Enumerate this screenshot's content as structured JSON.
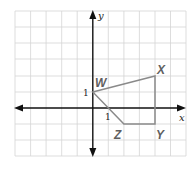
{
  "figure": {
    "type": "coordinate-grid",
    "axes": {
      "x_label": "x",
      "y_label": "y",
      "x_tick_label": "1",
      "y_tick_label": "1"
    },
    "grid": {
      "x_range": [
        -5,
        6
      ],
      "y_range": [
        -3,
        6
      ],
      "unit": 1
    },
    "polygon": {
      "vertices": [
        {
          "name": "W",
          "x": 0,
          "y": 1
        },
        {
          "name": "X",
          "x": 4,
          "y": 2
        },
        {
          "name": "Y",
          "x": 4,
          "y": -1
        },
        {
          "name": "Z",
          "x": 2,
          "y": -1
        }
      ],
      "stroke_color": "#8a8a8a"
    },
    "colors": {
      "grid": "#d4d4d4",
      "axes": "#111111",
      "labels": "#5f5f5f"
    }
  }
}
